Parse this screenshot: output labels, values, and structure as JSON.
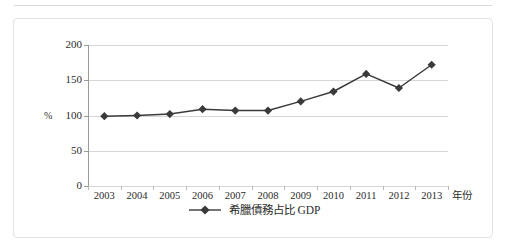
{
  "chart_data": {
    "type": "line",
    "title": "",
    "xlabel": "年份",
    "ylabel": "%",
    "categories": [
      "2003",
      "2004",
      "2005",
      "2006",
      "2007",
      "2008",
      "2009",
      "2010",
      "2011",
      "2012",
      "2013"
    ],
    "series": [
      {
        "name": "希臘債務占比 GDP",
        "values": [
          99,
          100,
          102,
          109,
          107,
          107,
          120,
          134,
          159,
          139,
          172
        ],
        "marker": "diamond",
        "color": "#3a3a3a"
      }
    ],
    "ylim": [
      0,
      200
    ],
    "yticks": [
      0,
      50,
      100,
      150,
      200
    ],
    "ytick_labels": [
      "0",
      "50",
      "100",
      "150",
      "200"
    ],
    "grid": "horizontal",
    "legend_position": "bottom"
  },
  "legend": {
    "label": "希臘債務占比 GDP"
  },
  "colors": {
    "series": "#3a3a3a",
    "grid": "#d6d6d6",
    "axis": "#9a9a9a",
    "frame": "#e2e2e2",
    "text": "#2b2b2b"
  }
}
